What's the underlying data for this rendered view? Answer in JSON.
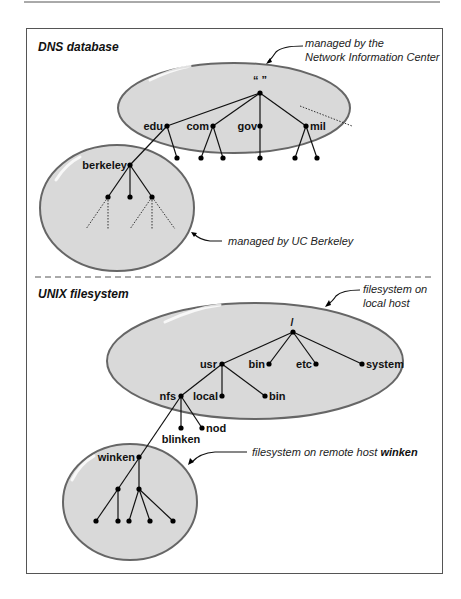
{
  "colors": {
    "zone_fill": "#d9d9d9",
    "zone_stroke": "#666666",
    "line": "#111111",
    "frame": "#555555"
  },
  "dns": {
    "title": "DNS database",
    "root_label": "“ ”",
    "tld_labels": [
      "edu",
      "com",
      "gov",
      "mil"
    ],
    "subdomain_label": "berkeley",
    "callout_top": [
      "managed by the",
      "Network Information Center"
    ],
    "callout_berkeley": "managed by UC Berkeley"
  },
  "unix": {
    "title": "UNIX filesystem",
    "root_label": "/",
    "top_dirs": [
      "usr",
      "bin",
      "etc",
      "system"
    ],
    "usr_dirs": [
      "nfs",
      "local",
      "bin"
    ],
    "nfs_dirs": [
      "blinken",
      "nod"
    ],
    "remote_label": "winken",
    "callout_local": [
      "filesystem on",
      "local host"
    ],
    "callout_remote_prefix": "filesystem on remote host ",
    "callout_remote_host": "winken"
  }
}
